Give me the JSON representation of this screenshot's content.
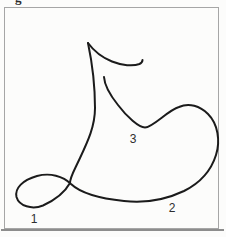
{
  "page": {
    "background": "#fcfcfb"
  },
  "cropped_header": {
    "fragment_text": "g"
  },
  "figure": {
    "type": "single-stroke line drawing with numbered stroke points",
    "frame_color": "#a6a6a6",
    "bottom_rule_color": "#8d8d8d",
    "stroke_color": "#1b1b1b",
    "stroke_width": 2,
    "labels": [
      {
        "id": "point-1",
        "text": "1"
      },
      {
        "id": "point-2",
        "text": "2"
      },
      {
        "id": "point-3",
        "text": "3"
      }
    ],
    "paths": {
      "main": "M 88 43 C 92 62 95 85 95 108 C 95 126 88 141 80 158 C 74 171 70 177 70 183 C 65 192 55 200 43 205.5 C 32 210 19 206 16.5 197 C 14.5 188 23 180 37 176 C 50 172.5 63 176 71 184 C 80 192.5 100 198.5 124 201 C 146 203.5 166 199.5 184 191 C 199 183.5 211 171 216 155 C 220.5 141 218 124 208 114 C 200 106 189 102.5 179 107 C 168 110 153 127.5 145 127.5 C 139 127.5 127 117 118 105 C 110 95 104.5 85 104 77",
      "hook": "M 88 43 C 93.5 50.5 102 57.5 112 61.5 C 122 65.5 133 66.5 139.5 64 C 141.5 63 142.5 61.5 142.5 60"
    }
  }
}
